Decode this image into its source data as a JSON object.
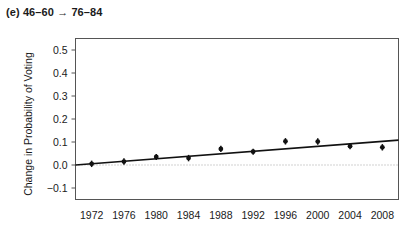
{
  "panel": {
    "title": "(e) 46–60 → 76–84",
    "label_letter": "(e)",
    "cohort_from": "46–60",
    "cohort_to": "76–84"
  },
  "colors": {
    "line": "#111111",
    "marker": "#111111",
    "frame": "#555555",
    "zero_line": "#9a9a9a",
    "text": "#1a1a1a",
    "background": "#ffffff"
  },
  "chart_data": {
    "type": "scatter",
    "title": "(e) 46–60 → 76–84",
    "xlabel": "",
    "ylabel": "Change in Probability of Voting",
    "x": [
      1972,
      1976,
      1980,
      1984,
      1988,
      1992,
      1996,
      2000,
      2004,
      2008
    ],
    "categories": [
      "1972",
      "1976",
      "1980",
      "1984",
      "1988",
      "1992",
      "1996",
      "2000",
      "2004",
      "2008"
    ],
    "values": [
      0.005,
      0.015,
      0.035,
      0.03,
      0.07,
      0.058,
      0.103,
      0.102,
      0.082,
      0.077
    ],
    "errors": [
      0.014,
      0.014,
      0.013,
      0.014,
      0.014,
      0.013,
      0.014,
      0.014,
      0.014,
      0.014
    ],
    "xlim": [
      1970,
      2010
    ],
    "ylim": [
      -0.15,
      0.55
    ],
    "yticks": [
      -0.1,
      0.0,
      0.1,
      0.2,
      0.3,
      0.4,
      0.5
    ],
    "ytick_labels": [
      "−0.1",
      "0.0",
      "0.1",
      "0.2",
      "0.3",
      "0.4",
      "0.5"
    ],
    "xticks": [
      1972,
      1976,
      1980,
      1984,
      1988,
      1992,
      1996,
      2000,
      2004,
      2008
    ],
    "xtick_labels": [
      "1972",
      "1976",
      "1980",
      "1984",
      "1988",
      "1992",
      "1996",
      "2000",
      "2004",
      "2008"
    ],
    "grid": false,
    "legend": null,
    "reference_lines": [
      {
        "name": "zero-line",
        "axis": "y",
        "value": 0.0,
        "style": "dotted"
      }
    ],
    "series": [
      {
        "name": "estimate-points",
        "type": "scatter",
        "values": [
          0.005,
          0.015,
          0.035,
          0.03,
          0.07,
          0.058,
          0.103,
          0.102,
          0.082,
          0.077
        ]
      },
      {
        "name": "fitted-trend",
        "type": "line",
        "x": [
          1970,
          2010
        ],
        "values": [
          0.0,
          0.108
        ]
      }
    ]
  }
}
